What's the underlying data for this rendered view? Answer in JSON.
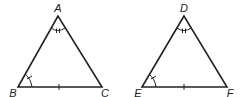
{
  "figure": {
    "triangles": [
      {
        "name": "ABC",
        "vertices": {
          "A": [
            58,
            16
          ],
          "B": [
            18,
            87
          ],
          "C": [
            102,
            87
          ]
        },
        "labels": {
          "top": "A",
          "left": "B",
          "right": "C"
        },
        "markings": {
          "top_angle": "double-arc-tick",
          "left_angle": "single-arc-tick",
          "base_side": "single-tick"
        }
      },
      {
        "name": "DEF",
        "vertices": {
          "D": [
            184,
            16
          ],
          "E": [
            142,
            87
          ],
          "F": [
            227,
            87
          ]
        },
        "labels": {
          "top": "D",
          "left": "E",
          "right": "F"
        },
        "markings": {
          "top_angle": "double-arc-tick",
          "left_angle": "single-arc-tick",
          "base_side": "single-tick"
        }
      }
    ],
    "stroke_color": "#222222"
  }
}
